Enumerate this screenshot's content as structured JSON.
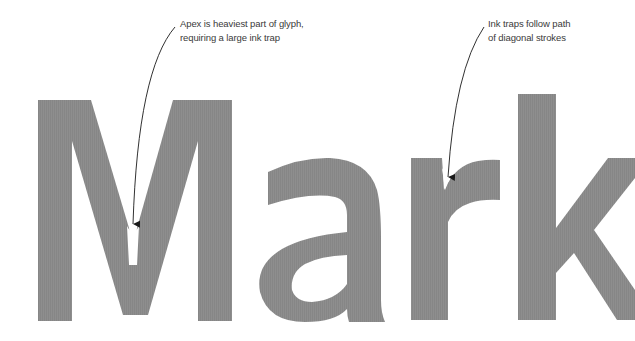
{
  "figure": {
    "word": "Mark",
    "glyph_color": "#8c8c8c",
    "background": "#ffffff",
    "glyphs": [
      {
        "char": "M",
        "note": "vertex with ink trap"
      },
      {
        "char": "a"
      },
      {
        "char": "r",
        "note": "shoulder with ink trap"
      },
      {
        "char": "k",
        "note": "cropped at right edge"
      }
    ]
  },
  "annotations": [
    {
      "id": "apex",
      "lines": [
        "Apex is heaviest part of glyph,",
        "requiring a large ink trap"
      ],
      "target": "M vertex"
    },
    {
      "id": "ink-traps",
      "lines": [
        "Ink traps follow path",
        "of diagonal strokes"
      ],
      "target": "r shoulder junction"
    }
  ],
  "arrow_color": "#1a1a1a"
}
